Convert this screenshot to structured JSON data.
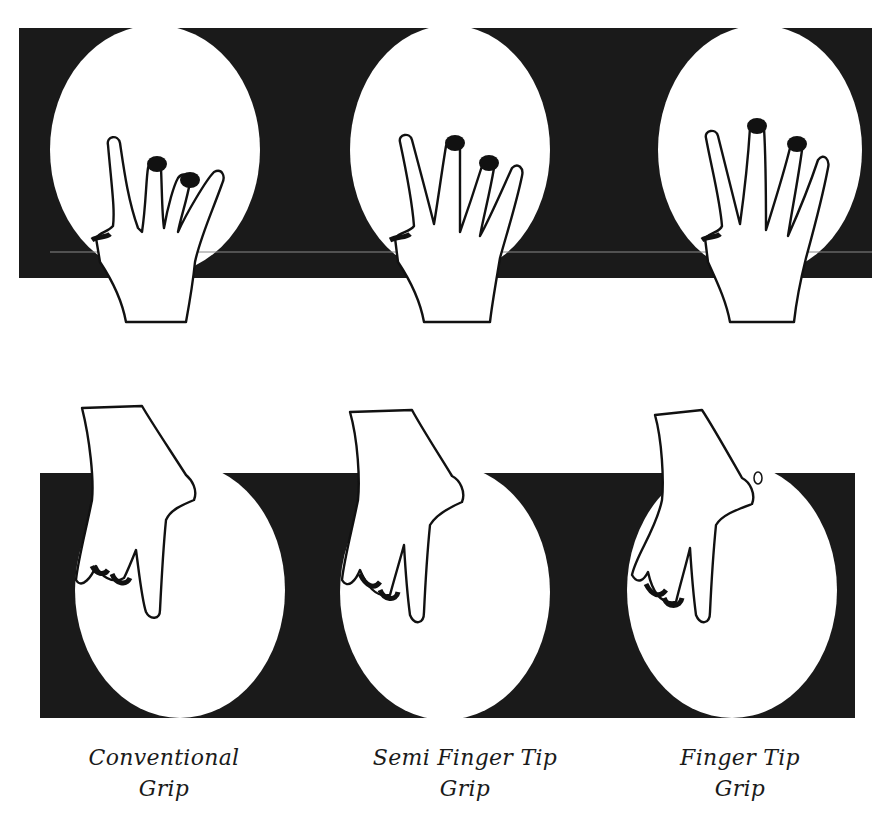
{
  "figure": {
    "rows": [
      {
        "view": "back-of-hand view, fingers in holes, ball on dark background",
        "position": "top"
      },
      {
        "view": "side view, hand reaching down into ball, ball on dark background",
        "position": "bottom"
      }
    ],
    "colors": {
      "panel": "#1a1a1a",
      "ball": "#ffffff",
      "ink": "#1a1a1a",
      "page": "#ffffff"
    }
  },
  "captions": [
    {
      "line1": "Conventional",
      "line2": "Grip"
    },
    {
      "line1": "Semi Finger Tip",
      "line2": "Grip"
    },
    {
      "line1": "Finger Tip",
      "line2": "Grip"
    }
  ]
}
